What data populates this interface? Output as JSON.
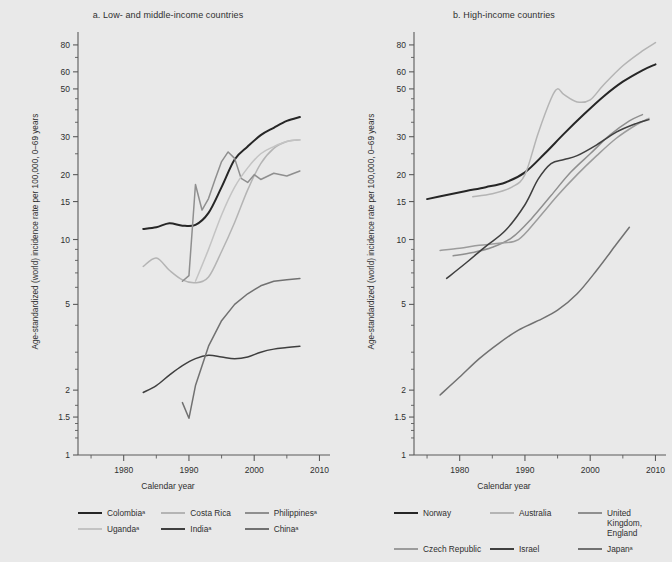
{
  "figure": {
    "background": "#e9e9e9",
    "width": 672,
    "height": 562
  },
  "panels": [
    {
      "id": "a",
      "title": "a. Low- and middle-income countries",
      "xlabel": "Calendar year",
      "ylabel": "Age-standardized (world) incidence rate per 100,000, 0–69 years"
    },
    {
      "id": "b",
      "title": "b. High-income countries",
      "xlabel": "Calendar year",
      "ylabel": "Age-standardized (world) incidence rate per 100,000, 0–69 years"
    }
  ],
  "legend_a": [
    {
      "label": "Colombiaᵃ",
      "color": "#262626"
    },
    {
      "label": "Costa Rica",
      "color": "#b4b4b4"
    },
    {
      "label": "Philippinesᵃ",
      "color": "#8f8f8f"
    },
    {
      "label": "Ugandaᵃ",
      "color": "#c3c3c3"
    },
    {
      "label": "Indiaᵃ",
      "color": "#3f3f3f"
    },
    {
      "label": "Chinaᵃ",
      "color": "#717171"
    }
  ],
  "legend_b": [
    {
      "label": "Norway",
      "color": "#262626"
    },
    {
      "label": "Australia",
      "color": "#b4b4b4"
    },
    {
      "label": "United Kingdom,\nEngland",
      "color": "#8f8f8f"
    },
    {
      "label": "Czech Republic",
      "color": "#9c9c9c"
    },
    {
      "label": "Israel",
      "color": "#3f3f3f"
    },
    {
      "label": "Japanᵃ",
      "color": "#717171"
    }
  ],
  "chart_data": [
    {
      "type": "line",
      "panel": "a",
      "title": "a. Low- and middle-income countries",
      "xlabel": "Calendar year",
      "ylabel": "Age-standardized (world) incidence rate per 100,000, 0–69 years",
      "yscale": "log",
      "xlim": [
        1973,
        2011
      ],
      "ylim": [
        1,
        88
      ],
      "xticks": [
        1980,
        1990,
        2000,
        2010
      ],
      "xminorticks": [
        1975,
        1985,
        1995,
        2005
      ],
      "yticks": [
        1,
        1.5,
        2,
        5,
        10,
        15,
        20,
        30,
        50,
        60,
        80
      ],
      "grid": false,
      "legend_position": "below",
      "series": [
        {
          "name": "Colombiaᵃ",
          "color": "#262626",
          "x": [
            1983,
            1985,
            1987,
            1989,
            1991,
            1993,
            1995,
            1997,
            1999,
            2001,
            2003,
            2005,
            2007
          ],
          "y": [
            11.2,
            11.4,
            11.9,
            11.6,
            11.7,
            13.3,
            17.5,
            23.5,
            27.0,
            30.5,
            33.0,
            35.5,
            37.0
          ]
        },
        {
          "name": "Costa Rica",
          "color": "#b4b4b4",
          "x": [
            1983,
            1985,
            1987,
            1989,
            1991,
            1993,
            1995,
            1997,
            1999,
            2001,
            2003,
            2005,
            2007
          ],
          "y": [
            7.5,
            8.2,
            7.2,
            6.5,
            6.3,
            6.7,
            8.8,
            12.0,
            17.0,
            22.5,
            26.5,
            28.5,
            29.0
          ]
        },
        {
          "name": "Philippinesᵃ",
          "color": "#8f8f8f",
          "x": [
            1989,
            1990,
            1991,
            1992,
            1993,
            1994,
            1995,
            1996,
            1997,
            1998,
            1999,
            2000,
            2001,
            2003,
            2005,
            2007
          ],
          "y": [
            6.4,
            6.8,
            18.0,
            13.7,
            15.5,
            19.0,
            23.0,
            25.5,
            23.8,
            19.2,
            18.4,
            20.0,
            19.0,
            20.3,
            19.7,
            20.8
          ]
        },
        {
          "name": "Ugandaᵃ",
          "color": "#c3c3c3",
          "x": [
            1991,
            1993,
            1995,
            1997,
            1999,
            2001,
            2003,
            2005,
            2007
          ],
          "y": [
            6.4,
            9.0,
            13.0,
            17.5,
            21.5,
            25.0,
            27.0,
            28.5,
            29.0
          ]
        },
        {
          "name": "Indiaᵃ",
          "color": "#3f3f3f",
          "x": [
            1983,
            1985,
            1987,
            1989,
            1991,
            1993,
            1995,
            1997,
            1999,
            2001,
            2003,
            2005,
            2007
          ],
          "y": [
            1.95,
            2.1,
            2.35,
            2.6,
            2.8,
            2.9,
            2.85,
            2.8,
            2.85,
            3.0,
            3.1,
            3.15,
            3.2
          ]
        },
        {
          "name": "Chinaᵃ",
          "color": "#717171",
          "x": [
            1989,
            1990,
            1991,
            1993,
            1995,
            1997,
            1999,
            2001,
            2003,
            2005,
            2007
          ],
          "y": [
            1.75,
            1.48,
            2.1,
            3.2,
            4.2,
            5.0,
            5.6,
            6.1,
            6.4,
            6.5,
            6.6
          ]
        }
      ]
    },
    {
      "type": "line",
      "panel": "b",
      "title": "b. High-income countries",
      "xlabel": "Calendar year",
      "ylabel": "Age-standardized (world) incidence rate per 100,000, 0–69 years",
      "yscale": "log",
      "xlim": [
        1973,
        2011
      ],
      "ylim": [
        1,
        88
      ],
      "xticks": [
        1980,
        1990,
        2000,
        2010
      ],
      "xminorticks": [
        1975,
        1985,
        1995,
        2005
      ],
      "yticks": [
        1,
        1.5,
        2,
        5,
        10,
        15,
        20,
        30,
        50,
        60,
        80
      ],
      "grid": false,
      "legend_position": "below",
      "series": [
        {
          "name": "Norway",
          "color": "#262626",
          "x": [
            1975,
            1978,
            1981,
            1984,
            1987,
            1990,
            1993,
            1996,
            1999,
            2002,
            2005,
            2008,
            2010
          ],
          "y": [
            15.4,
            16.1,
            16.8,
            17.5,
            18.4,
            20.5,
            25.0,
            31.0,
            38.0,
            46.0,
            54.0,
            61.0,
            65.0
          ]
        },
        {
          "name": "Australia",
          "color": "#b4b4b4",
          "x": [
            1982,
            1985,
            1988,
            1990,
            1992,
            1994,
            1995,
            1996,
            1998,
            2000,
            2002,
            2005,
            2008,
            2010
          ],
          "y": [
            15.8,
            16.3,
            17.5,
            20.0,
            31.0,
            45.0,
            50.0,
            47.0,
            43.5,
            44.5,
            52.0,
            64.0,
            75.0,
            82.0
          ]
        },
        {
          "name": "United Kingdom, England",
          "color": "#8f8f8f",
          "x": [
            1979,
            1982,
            1985,
            1988,
            1991,
            1994,
            1997,
            2000,
            2003,
            2006,
            2008
          ],
          "y": [
            8.4,
            8.7,
            9.2,
            10.2,
            12.5,
            16.0,
            20.5,
            25.0,
            30.5,
            35.5,
            38.0
          ]
        },
        {
          "name": "Czech Republic",
          "color": "#9c9c9c",
          "x": [
            1977,
            1980,
            1983,
            1986,
            1989,
            1992,
            1995,
            1998,
            2001,
            2004,
            2007,
            2009
          ],
          "y": [
            8.9,
            9.1,
            9.4,
            9.6,
            10.0,
            12.5,
            16.0,
            20.0,
            24.5,
            29.5,
            34.0,
            36.5
          ]
        },
        {
          "name": "Israel",
          "color": "#3f3f3f",
          "x": [
            1978,
            1981,
            1984,
            1987,
            1990,
            1992,
            1994,
            1996,
            1998,
            2001,
            2004,
            2007,
            2009
          ],
          "y": [
            6.6,
            7.8,
            9.3,
            11.0,
            14.5,
            19.0,
            22.5,
            23.5,
            24.5,
            27.5,
            31.5,
            34.5,
            36.0
          ]
        },
        {
          "name": "Japanᵃ",
          "color": "#717171",
          "x": [
            1977,
            1980,
            1983,
            1986,
            1989,
            1992,
            1995,
            1998,
            2001,
            2004,
            2006
          ],
          "y": [
            1.9,
            2.3,
            2.8,
            3.3,
            3.8,
            4.2,
            4.7,
            5.6,
            7.2,
            9.5,
            11.4
          ]
        }
      ]
    }
  ]
}
